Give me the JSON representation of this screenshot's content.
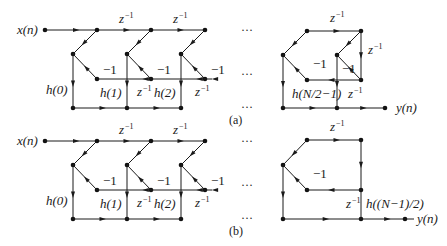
{
  "figure": {
    "panels": [
      {
        "id": "a",
        "caption": "(a)",
        "input_label": "x(n)",
        "output_label": "y(n)",
        "stages": [
          {
            "delay_top": "",
            "neg": "−1",
            "delay_bottom": "",
            "coef": "h(0)"
          },
          {
            "delay_top": "z",
            "neg": "−1",
            "delay_bottom": "z",
            "coef": "h(1)"
          },
          {
            "delay_top": "z",
            "neg": "−1",
            "delay_bottom": "z",
            "coef": "h(2)"
          }
        ],
        "final_stage": {
          "delay_top": "z",
          "delay_right": "z",
          "delay_bottom": "z",
          "neg_left": "−1",
          "neg_right": "−1",
          "coef": "h(N/2−1)"
        },
        "ellipsis": "···"
      },
      {
        "id": "b",
        "caption": "(b)",
        "input_label": "x(n)",
        "output_label": "y(n)",
        "stages": [
          {
            "delay_top": "",
            "neg": "−1",
            "delay_bottom": "",
            "coef": "h(0)"
          },
          {
            "delay_top": "z",
            "neg": "−1",
            "delay_bottom": "z",
            "coef": "h(1)"
          },
          {
            "delay_top": "z",
            "neg": "−1",
            "delay_bottom": "z",
            "coef": "h(2)"
          }
        ],
        "final_stage": {
          "delay_top": "z",
          "delay_bottom": "z",
          "neg": "−1",
          "coef": "h((N−1)/2)"
        },
        "ellipsis": "···"
      }
    ],
    "exponent": "−1"
  }
}
